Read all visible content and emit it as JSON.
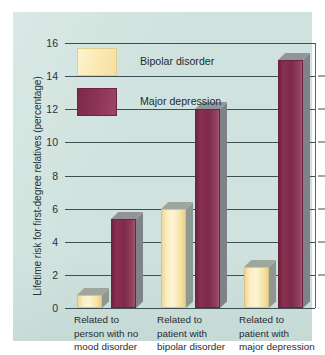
{
  "chart_data": {
    "type": "bar",
    "title": "",
    "subtitle": "",
    "xlabel": "",
    "ylabel": "Lifetime risk for first-degree relatives (percentage)",
    "categories": [
      "Related to\nperson with no\nmood disorder",
      "Related to\npatient with\nbipolar disorder",
      "Related to\npatient with\nmajor depression"
    ],
    "category_lines": [
      [
        "Related to",
        "person with no",
        "mood disorder"
      ],
      [
        "Related to",
        "patient with",
        "bipolar disorder"
      ],
      [
        "Related to",
        "patient with",
        "major depression"
      ]
    ],
    "series": [
      {
        "name": "Bipolar disorder",
        "color": "#fbeab6",
        "values": [
          0.8,
          6.0,
          2.5
        ]
      },
      {
        "name": "Major depression",
        "color": "#8b3253",
        "values": [
          5.4,
          12.0,
          15.0
        ]
      }
    ],
    "ylim": [
      0,
      16
    ],
    "yticks": [
      0,
      2,
      4,
      6,
      8,
      10,
      12,
      14,
      16
    ],
    "ytick_labels": [
      "0",
      "2",
      "4",
      "6",
      "8",
      "10",
      "12",
      "14",
      "16"
    ],
    "grid": true,
    "grid_axis": "y",
    "legend_position": "upper left",
    "background_color": "#cfe2dd",
    "axis_color": "#3d4e55"
  },
  "legend": {
    "items": [
      {
        "label": "Bipolar disorder",
        "swatch": "bipolar-swatch"
      },
      {
        "label": "Major depression",
        "swatch": "depression-swatch"
      }
    ]
  }
}
